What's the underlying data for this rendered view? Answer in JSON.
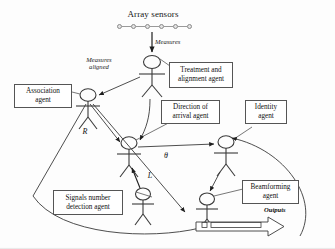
{
  "diagram": {
    "type": "multi-agent-architecture",
    "title": "Array sensors",
    "sensors": {
      "count": 6,
      "label": "Array sensors"
    },
    "edge_labels": {
      "measures": "Measures",
      "measures_aligned": "Measures\naligned",
      "correlation_r": "R",
      "theta": "θ",
      "signal_count_l": "L",
      "outputs": "Outputs"
    },
    "agents": [
      {
        "id": "treatment",
        "label": "Treatment and\nalignment agent"
      },
      {
        "id": "association",
        "label": "Association\nagent"
      },
      {
        "id": "doa",
        "label": "Direction of\narrival agent"
      },
      {
        "id": "identity",
        "label": "Identity\nagent"
      },
      {
        "id": "signals",
        "label": "Signals number\ndetection agent"
      },
      {
        "id": "beamforming",
        "label": "Beamforming\nagent"
      }
    ],
    "colors": {
      "stroke": "#3a3a3a",
      "box_border": "#555555",
      "text": "#111111",
      "sensor_fill": "#e4e4e4",
      "background": "#fdfdfd"
    }
  }
}
